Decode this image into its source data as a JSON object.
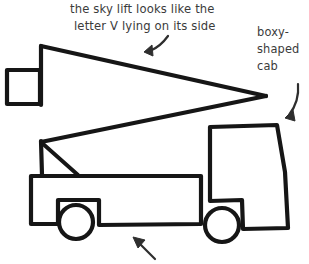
{
  "page": {
    "background_color": "#ffffff",
    "ink_color": "#161616",
    "text_color": "#3b3b3b",
    "arrow_color": "#2e2e2e",
    "width": 309,
    "height": 264
  },
  "annotations": {
    "sky_lift": {
      "name": "sky-lift-annotation",
      "line1": "the sky lift looks like the",
      "line2": "letter V lying on its side",
      "arrow": "curved-arrow-down-left"
    },
    "cab": {
      "name": "cab-annotation",
      "line1": "boxy-",
      "line2": "shaped",
      "line3": "cab",
      "arrow": "curved-arrow-down-left"
    },
    "bed": {
      "name": "bed-annotation",
      "arrow": "straight-arrow-up-left"
    }
  },
  "drawing": {
    "parts": {
      "bucket": "bucket-square",
      "lift_upper_arm": "sky-lift-upper-arm",
      "lift_lower_arm": "sky-lift-lower-arm",
      "lift_mast": "sky-lift-mast",
      "lift_brace": "sky-lift-diagonal-brace",
      "bed": "truck-bed",
      "cab": "truck-cab",
      "rear_wheel": "rear-wheel",
      "front_wheel": "front-wheel"
    }
  }
}
